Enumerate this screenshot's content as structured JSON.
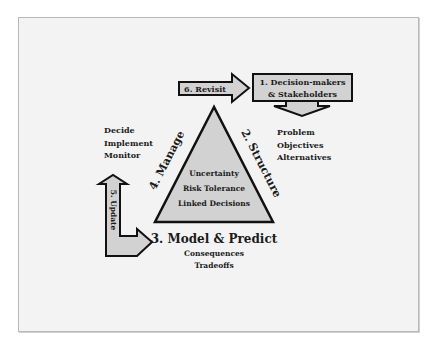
{
  "diagram": {
    "steps": {
      "step1": {
        "line1": "1. Decision-makers",
        "line2": "& Stakeholders"
      },
      "step2": "2. Structure",
      "step3": "3. Model & Predict",
      "step4": "4. Manage",
      "step5": "5. Update",
      "step6": "6. Revisit"
    },
    "structure_items": [
      "Problem",
      "Objectives",
      "Alternatives"
    ],
    "manage_items": [
      "Decide",
      "Implement",
      "Monitor"
    ],
    "model_items": [
      "Consequences",
      "Tradeoffs"
    ],
    "triangle_items": [
      "Uncertainty",
      "Risk Tolerance",
      "Linked Decisions"
    ],
    "colors": {
      "shape_fill": "#d2d2d2",
      "outline": "#111111",
      "background": "#f3f3f3",
      "frame_border": "#b8b8b8"
    }
  }
}
